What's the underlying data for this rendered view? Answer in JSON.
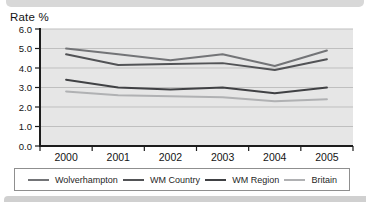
{
  "chart": {
    "title": "Rate %"
  },
  "chart_data": {
    "type": "line",
    "title": "Rate %",
    "ylabel": "Rate %",
    "xlabel": "",
    "categories": [
      "2000",
      "2001",
      "2002",
      "2003",
      "2004",
      "2005"
    ],
    "series": [
      {
        "name": "Wolverhampton",
        "color": "#737477",
        "values": [
          5.0,
          4.7,
          4.4,
          4.7,
          4.1,
          4.9
        ]
      },
      {
        "name": "WM Country",
        "color": "#525356",
        "values": [
          4.7,
          4.15,
          4.2,
          4.25,
          3.9,
          4.45
        ]
      },
      {
        "name": "WM Region",
        "color": "#404144",
        "values": [
          3.4,
          3.0,
          2.9,
          3.0,
          2.7,
          3.0
        ]
      },
      {
        "name": "Britain",
        "color": "#b0b1b3",
        "values": [
          2.8,
          2.6,
          2.55,
          2.5,
          2.3,
          2.4
        ]
      }
    ],
    "ylim": [
      0,
      6
    ],
    "y_ticks": [
      "6.0",
      "5.0",
      "4.0",
      "3.0",
      "2.0",
      "1.0",
      "0.0"
    ],
    "grid": true,
    "legend_position": "bottom",
    "colors": {
      "plot_bg": "#e6e6e6",
      "grid": "#bfbfbf",
      "axis": "#1c1c1c",
      "tick_text": "#141414"
    }
  }
}
